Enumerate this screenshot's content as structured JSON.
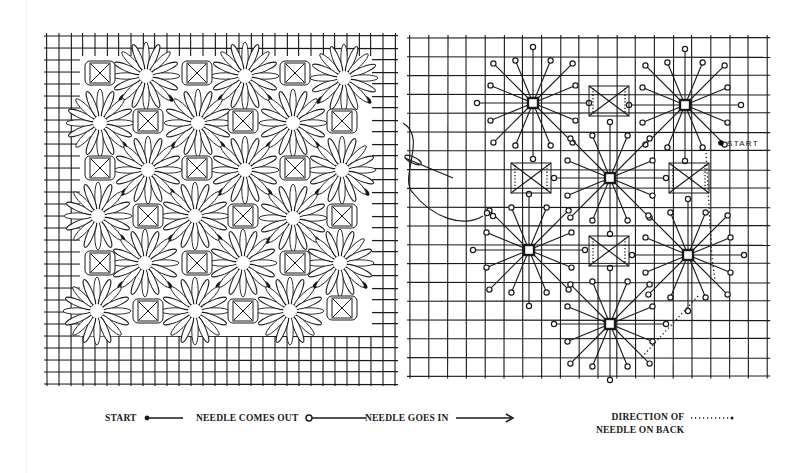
{
  "figure": {
    "left_panel": {
      "title": "Finished stitch pattern",
      "grid": {
        "x0": 7,
        "y0": 8,
        "cols": 29,
        "rows": 29,
        "cell": 12,
        "stroke": "#1a1a1a"
      },
      "flowers": [
        {
          "cx": 106,
          "cy": 48
        },
        {
          "cx": 205,
          "cy": 48
        },
        {
          "cx": 304,
          "cy": 50
        },
        {
          "cx": 60,
          "cy": 95
        },
        {
          "cx": 158,
          "cy": 95
        },
        {
          "cx": 253,
          "cy": 95
        },
        {
          "cx": 108,
          "cy": 142
        },
        {
          "cx": 205,
          "cy": 142
        },
        {
          "cx": 302,
          "cy": 142
        },
        {
          "cx": 58,
          "cy": 188
        },
        {
          "cx": 155,
          "cy": 188
        },
        {
          "cx": 253,
          "cy": 190
        },
        {
          "cx": 105,
          "cy": 235
        },
        {
          "cx": 203,
          "cy": 235
        },
        {
          "cx": 300,
          "cy": 235
        },
        {
          "cx": 57,
          "cy": 283
        },
        {
          "cx": 155,
          "cy": 283
        },
        {
          "cx": 250,
          "cy": 283
        }
      ],
      "cross_squares": [
        {
          "x": 60,
          "y": 45
        },
        {
          "x": 157,
          "y": 45
        },
        {
          "x": 255,
          "y": 45
        },
        {
          "x": 108,
          "y": 93
        },
        {
          "x": 203,
          "y": 93
        },
        {
          "x": 302,
          "y": 93
        },
        {
          "x": 60,
          "y": 140
        },
        {
          "x": 157,
          "y": 140
        },
        {
          "x": 255,
          "y": 140
        },
        {
          "x": 108,
          "y": 188
        },
        {
          "x": 203,
          "y": 188
        },
        {
          "x": 302,
          "y": 188
        },
        {
          "x": 60,
          "y": 235
        },
        {
          "x": 157,
          "y": 235
        },
        {
          "x": 255,
          "y": 235
        },
        {
          "x": 108,
          "y": 283
        },
        {
          "x": 203,
          "y": 283
        },
        {
          "x": 302,
          "y": 280
        }
      ]
    },
    "right_panel": {
      "title": "Stitch working diagram",
      "grid": {
        "x0": 7,
        "y0": 10,
        "cols": 19,
        "rows": 18,
        "cell": 18.8,
        "stroke": "#1a1a1a"
      },
      "start_label": "START",
      "start_point": {
        "x": 318,
        "y": 115
      },
      "centers": [
        {
          "cx": 130,
          "cy": 75,
          "name": "upper-left"
        },
        {
          "cx": 282,
          "cy": 77,
          "name": "upper-right"
        },
        {
          "cx": 207,
          "cy": 150,
          "name": "middle"
        },
        {
          "cx": 126,
          "cy": 222,
          "name": "lower-left"
        },
        {
          "cx": 285,
          "cy": 227,
          "name": "lower-right"
        },
        {
          "cx": 207,
          "cy": 296,
          "name": "bottom"
        }
      ],
      "small_squares": [
        {
          "x": 186,
          "y": 58,
          "w": 40,
          "h": 30
        },
        {
          "x": 108,
          "y": 135,
          "w": 40,
          "h": 30
        },
        {
          "x": 266,
          "y": 135,
          "w": 40,
          "h": 30
        },
        {
          "x": 186,
          "y": 208,
          "w": 40,
          "h": 30
        }
      ],
      "thread_path": "M 0 95 C 25 110, -5 150, 10 165 C 30 190, 60 200, 80 188",
      "needle": {
        "x1": 2,
        "y1": 130,
        "x2": 50,
        "y2": 150
      }
    }
  },
  "legend": {
    "items": [
      {
        "label": "START",
        "symbol": "filled-dot-line"
      },
      {
        "label": "NEEDLE COMES OUT",
        "symbol": "open-circle-line"
      },
      {
        "label": "NEEDLE GOES IN",
        "symbol": "arrow-line"
      },
      {
        "label_line1": "DIRECTION OF",
        "label_line2": "NEEDLE ON BACK",
        "symbol": "dotted-line"
      }
    ]
  }
}
